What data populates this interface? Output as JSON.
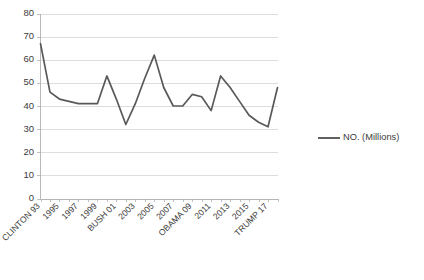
{
  "chart_data": {
    "type": "line",
    "title": "",
    "xlabel": "",
    "ylabel": "",
    "ylim": [
      0,
      80
    ],
    "ytick_step": 10,
    "ytick_labels": [
      "0",
      "10",
      "20",
      "30",
      "40",
      "50",
      "60",
      "70",
      "80"
    ],
    "grid": true,
    "legend_position": "right",
    "line_color": "#595959",
    "gridline_color": "#d4d4d4",
    "axis_color": "#b0b0b0",
    "series": [
      {
        "name": "NO. (Millions)",
        "values": [
          67,
          46,
          43,
          42,
          41,
          41,
          41,
          53,
          43,
          32,
          41,
          52,
          62,
          48,
          40,
          40,
          45,
          44,
          38,
          53,
          48,
          42,
          36,
          33,
          31,
          48
        ]
      }
    ],
    "x": [
      1993,
      1994,
      1995,
      1996,
      1997,
      1998,
      1999,
      2000,
      2001,
      2002,
      2003,
      2004,
      2005,
      2006,
      2007,
      2008,
      2009,
      2010,
      2011,
      2012,
      2013,
      2014,
      2015,
      2016,
      2017,
      2018
    ],
    "xtick_labels": [
      {
        "index": 0,
        "label": "CLINTON 93"
      },
      {
        "index": 2,
        "label": "1995"
      },
      {
        "index": 4,
        "label": "1997"
      },
      {
        "index": 6,
        "label": "1999"
      },
      {
        "index": 8,
        "label": "BUSH 01"
      },
      {
        "index": 10,
        "label": "2003"
      },
      {
        "index": 12,
        "label": "2005"
      },
      {
        "index": 14,
        "label": "2007"
      },
      {
        "index": 16,
        "label": "OBAMA 09"
      },
      {
        "index": 18,
        "label": "2011"
      },
      {
        "index": 20,
        "label": "2013"
      },
      {
        "index": 22,
        "label": "2015"
      },
      {
        "index": 24,
        "label": "TRUMP 17"
      }
    ]
  },
  "legend": {
    "entries": [
      {
        "label": "NO. (Millions)",
        "color": "#595959"
      }
    ]
  }
}
